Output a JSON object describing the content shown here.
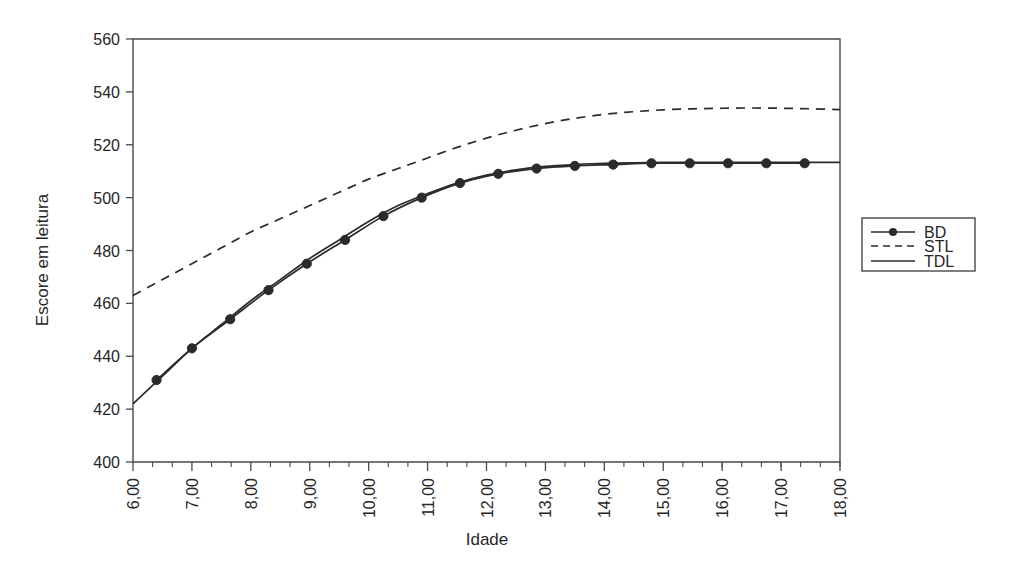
{
  "chart_data": {
    "type": "line",
    "title": "",
    "xlabel": "Idade",
    "ylabel": "Escore em leitura",
    "xlim": [
      6,
      18
    ],
    "ylim": [
      400,
      560
    ],
    "grid": false,
    "legend_position": "right",
    "x_tick_labels": [
      "6,00",
      "7,00",
      "8,00",
      "9,00",
      "10,00",
      "11,00",
      "12,00",
      "13,00",
      "14,00",
      "15,00",
      "16,00",
      "17,00",
      "18,00"
    ],
    "x_ticks": [
      6,
      7,
      8,
      9,
      10,
      11,
      12,
      13,
      14,
      15,
      16,
      17,
      18
    ],
    "x_minor_step": 0.3333,
    "y_tick_labels": [
      "400",
      "420",
      "440",
      "460",
      "480",
      "500",
      "520",
      "540",
      "560"
    ],
    "y_ticks": [
      400,
      420,
      440,
      460,
      480,
      500,
      520,
      540,
      560
    ],
    "series": [
      {
        "name": "BD",
        "style": "solid-with-markers",
        "marker": "filled-circle",
        "x": [
          6.4,
          7.0,
          7.65,
          8.3,
          8.95,
          9.6,
          10.25,
          10.9,
          11.55,
          12.2,
          12.85,
          13.5,
          14.15,
          14.8,
          15.45,
          16.1,
          16.75,
          17.4
        ],
        "values": [
          431,
          443,
          454,
          465,
          475,
          484,
          493,
          500,
          505.5,
          509,
          511,
          512,
          512.5,
          513,
          513,
          513,
          513,
          513
        ]
      },
      {
        "name": "STL",
        "style": "dashed",
        "marker": "none",
        "x": [
          6,
          6.5,
          7,
          7.5,
          8,
          8.5,
          9,
          9.5,
          10,
          10.5,
          11,
          11.5,
          12,
          12.5,
          13,
          13.5,
          14,
          14.5,
          15,
          15.5,
          16,
          16.5,
          17,
          17.5,
          18
        ],
        "values": [
          463,
          469,
          475,
          481,
          487,
          492,
          497,
          502,
          507,
          511,
          515,
          519,
          522.5,
          525.5,
          528,
          530,
          531.5,
          532.5,
          533.2,
          533.6,
          533.8,
          533.9,
          533.8,
          533.6,
          533.3
        ]
      },
      {
        "name": "TDL",
        "style": "solid",
        "marker": "none",
        "x": [
          6,
          6.5,
          7,
          7.5,
          8,
          8.5,
          9,
          9.5,
          10,
          10.5,
          11,
          11.5,
          12,
          12.5,
          13,
          13.5,
          14,
          14.5,
          15,
          15.5,
          16,
          16.5,
          17,
          17.5,
          18
        ],
        "values": [
          422,
          432.5,
          443,
          452,
          461,
          469,
          477,
          484,
          491,
          497,
          501.5,
          505.5,
          508.5,
          510.5,
          511.8,
          512.5,
          513,
          513.2,
          513.3,
          513.3,
          513.3,
          513.3,
          513.3,
          513.3,
          513.3
        ]
      }
    ]
  },
  "legend": {
    "entries": [
      {
        "label": "BD"
      },
      {
        "label": "STL"
      },
      {
        "label": "TDL"
      }
    ]
  },
  "colors": {
    "line": "#2b2b2b",
    "axis": "#4a4a4a",
    "text": "#262626",
    "background": "#ffffff"
  }
}
